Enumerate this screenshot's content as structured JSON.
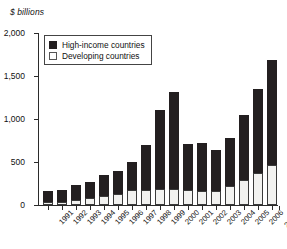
{
  "chart_data": {
    "type": "bar",
    "subtype": "stacked-bar",
    "title": "",
    "xlabel": "",
    "ylabel": "$ billions",
    "ylim": [
      0,
      2000
    ],
    "yticks": [
      0,
      500,
      1000,
      1500,
      2000
    ],
    "ytick_labels": [
      "0",
      "500",
      "1,000",
      "1,500",
      "2,000"
    ],
    "grid": false,
    "legend_position": "top-left",
    "categories": [
      "1991",
      "1992",
      "1993",
      "1994",
      "1995",
      "1996",
      "1997",
      "1998",
      "1999",
      "2000",
      "2001",
      "2002",
      "2003",
      "2004",
      "2005",
      "2006",
      "2007e"
    ],
    "series": [
      {
        "name": "Developing countries",
        "color": "#f2f2f0",
        "values": [
          30,
          35,
          60,
          80,
          105,
          130,
          170,
          180,
          185,
          190,
          170,
          165,
          165,
          220,
          290,
          370,
          470
        ]
      },
      {
        "name": "High-income countries",
        "color": "#231f20",
        "values": [
          130,
          145,
          175,
          190,
          245,
          270,
          325,
          520,
          915,
          1120,
          545,
          560,
          470,
          555,
          760,
          980,
          1215
        ]
      }
    ],
    "totals": [
      160,
      180,
      235,
      270,
      350,
      400,
      495,
      700,
      1100,
      1310,
      715,
      725,
      635,
      775,
      1050,
      1350,
      1685
    ]
  },
  "axis": {
    "unit_label": "$ billions"
  },
  "legend": {
    "items": [
      {
        "label": "High-income countries",
        "swatch": "black-square-icon"
      },
      {
        "label": "Developing countries",
        "swatch": "white-square-icon"
      }
    ]
  }
}
